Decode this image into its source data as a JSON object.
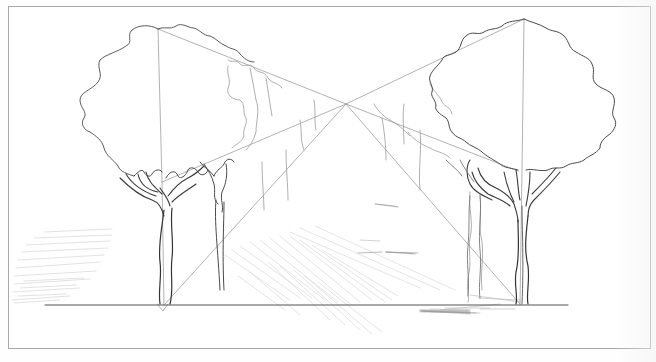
{
  "image": {
    "title": "One-point perspective sketch: avenue of trees",
    "description": "Pencil drawing of two large trees framing a path receding to a central vanishing point, with construction lines and light hatching",
    "style": "graphite pencil line art",
    "colors": {
      "paper": "#ffffff",
      "frame": "#a9a9a9",
      "dark_line": "#3a3a3a",
      "medium_line": "#6e6e6e",
      "light_line": "#b4b4b4",
      "hatch": "#c8c8c8"
    }
  },
  "scene": {
    "vanishing_point": {
      "x": 346,
      "y": 104
    },
    "ground_line": {
      "y": 305,
      "x_start": 45,
      "x_end": 568
    },
    "left_tree": {
      "trunk_base_x": 163,
      "crown_top_x": 158,
      "crown_top_y": 29
    },
    "right_tree": {
      "trunk_base_x": 520,
      "crown_top_x": 524,
      "crown_top_y": 19
    },
    "elements": [
      "left-foreground-tree",
      "right-foreground-tree",
      "background-trees-left",
      "background-trees-right",
      "perspective-construction-lines",
      "ground-hatching",
      "ground-line"
    ]
  },
  "caption": ""
}
